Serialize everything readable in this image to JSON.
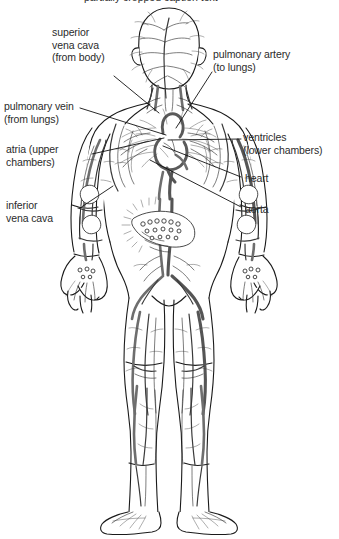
{
  "figure": {
    "background_color": "#ffffff",
    "ink_color": "#1a1a1a",
    "text_color": "#2b2b2b",
    "vessel_grey": "#6e6e6e",
    "clipped_top_caption": "partially cropped caption text"
  },
  "labels": [
    {
      "id": "superior-vena-cava",
      "lines": [
        "superior",
        "vena cava",
        "(from body)"
      ],
      "text": "superior\nvena cava\n(from body)",
      "x": 52,
      "y": 26,
      "align": "left"
    },
    {
      "id": "pulmonary-artery",
      "lines": [
        "pulmonary artery",
        "(to lungs)"
      ],
      "text": "pulmonary artery\n(to lungs)",
      "x": 213,
      "y": 48,
      "align": "left"
    },
    {
      "id": "pulmonary-vein",
      "lines": [
        "pulmonary vein",
        "(from lungs)"
      ],
      "text": "pulmonary vein\n(from lungs)",
      "x": 4,
      "y": 100,
      "align": "left"
    },
    {
      "id": "atria",
      "lines": [
        "atria (upper",
        "chambers)"
      ],
      "text": "atria (upper\nchambers)",
      "x": 6,
      "y": 143,
      "align": "left"
    },
    {
      "id": "ventricles",
      "lines": [
        "ventricles",
        "(lower chambers)"
      ],
      "text": "ventricles\n(lower chambers)",
      "x": 243,
      "y": 131,
      "align": "left"
    },
    {
      "id": "heart",
      "lines": [
        "heart"
      ],
      "text": "heart",
      "x": 245,
      "y": 172,
      "align": "left"
    },
    {
      "id": "aorta",
      "lines": [
        "aorta"
      ],
      "text": "aorta",
      "x": 245,
      "y": 203,
      "align": "left"
    },
    {
      "id": "inferior-vena-cava",
      "lines": [
        "inferior",
        "vena cava"
      ],
      "text": "inferior\nvena cava",
      "x": 6,
      "y": 199,
      "align": "left"
    }
  ],
  "leader_lines": [
    {
      "id": "leader-superior-vena-cava",
      "from": [
        114,
        76
      ],
      "to": [
        159,
        113
      ]
    },
    {
      "id": "leader-pulmonary-artery",
      "from": [
        212,
        72
      ],
      "to": [
        176,
        128
      ]
    },
    {
      "id": "leader-pulmonary-vein",
      "from": [
        80,
        108
      ],
      "to": [
        166,
        135
      ]
    },
    {
      "id": "leader-atria",
      "from": [
        92,
        154
      ],
      "to": [
        164,
        138
      ]
    },
    {
      "id": "leader-ventricles",
      "from": [
        241,
        139
      ],
      "to": [
        168,
        140
      ]
    },
    {
      "id": "leader-heart",
      "from": [
        241,
        177
      ],
      "to": [
        163,
        146
      ]
    },
    {
      "id": "leader-aorta",
      "from": [
        241,
        207
      ],
      "to": [
        150,
        160
      ]
    },
    {
      "id": "leader-inferior-vena-cava",
      "from": [
        80,
        208
      ],
      "to": [
        113,
        186
      ]
    }
  ]
}
